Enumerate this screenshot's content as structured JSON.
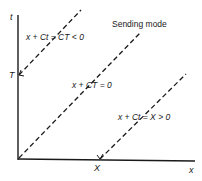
{
  "diagram": {
    "title": "Sending mode",
    "axes": {
      "vertical_label": "t",
      "horizontal_label": "x",
      "t_marker": "T",
      "x_marker": "X"
    },
    "lines": [
      {
        "label": "x + Ct = CT < 0",
        "style": "dashed"
      },
      {
        "label": "x + CT = 0",
        "style": "dashed"
      },
      {
        "label": "x + Ct = X > 0",
        "style": "dashed"
      }
    ],
    "colors": {
      "ink": "#1a1a1a",
      "background": "#ffffff"
    }
  }
}
